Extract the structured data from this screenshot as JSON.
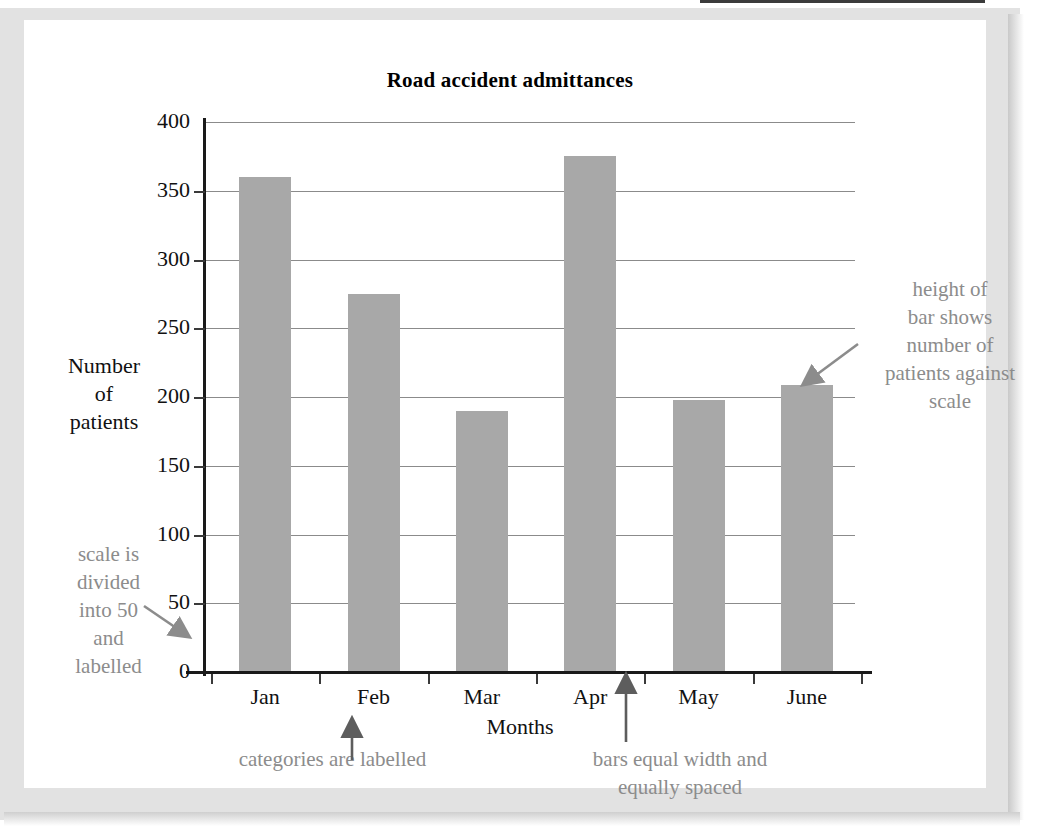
{
  "chart_data": {
    "type": "bar",
    "title": "Road accident admittances",
    "xlabel": "Months",
    "ylabel": "Number of patients",
    "categories": [
      "Jan",
      "Feb",
      "Mar",
      "Apr",
      "May",
      "June"
    ],
    "values": [
      360,
      275,
      190,
      375,
      198,
      209
    ],
    "ylim": [
      0,
      400
    ],
    "yticks": [
      0,
      50,
      100,
      150,
      200,
      250,
      300,
      350,
      400
    ],
    "ytick_labels": [
      "0",
      "50",
      "100",
      "150",
      "200",
      "250",
      "300",
      "350",
      "400"
    ],
    "y_tick_step": 50,
    "grid": true,
    "legend": "none",
    "bar_color": "#a8a8a8",
    "axis_color": "#1a1a1a",
    "gridline_color": "#8b8b8b",
    "annotation_color": "#8c8c8c",
    "annotations": [
      {
        "id": "height-of-bar",
        "text": "height of bar shows number of patients against scale",
        "lines": [
          "height of",
          "bar shows",
          "number of",
          "patients against",
          "scale"
        ],
        "position": "right",
        "points_to": "top of June bar"
      },
      {
        "id": "scale-divided",
        "text": "scale is divided into 50 and labelled",
        "lines": [
          "scale is",
          "divided",
          "into 50",
          "and",
          "labelled"
        ],
        "position": "left",
        "points_to": "y-axis scale"
      },
      {
        "id": "categories-labelled",
        "text": "categories are labelled",
        "lines": [
          "categories are labelled"
        ],
        "position": "bottom-left",
        "points_to": "Feb category label"
      },
      {
        "id": "bars-equal-width",
        "text": "bars equal width and equally spaced",
        "lines": [
          "bars equal width and",
          "equally spaced"
        ],
        "position": "bottom-right",
        "points_to": "gap between Apr and May bars"
      }
    ]
  },
  "axis_title_y_lines": [
    "Number",
    "of",
    "patients"
  ]
}
